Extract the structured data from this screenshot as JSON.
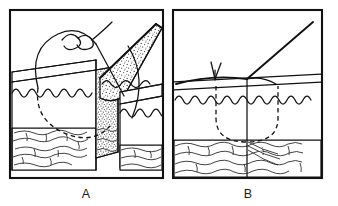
{
  "figure": {
    "background_color": "#ffffff",
    "ink_color": "#111111",
    "width": 338,
    "height": 206,
    "panels": [
      {
        "id": "A",
        "label": "A",
        "caption_position": "below",
        "view": "three-quarter block diagram",
        "description": "Skin block with elevated dermal flap, stippled cut dermis surface, wavy epidermal surface line, lobular subcutaneous fat, and a suture loop with knot above the surface",
        "frame": {
          "x": 10,
          "y": 10,
          "width": 153,
          "height": 168
        },
        "features": [
          {
            "name": "epidermis-wavy-line",
            "label": "epidermis"
          },
          {
            "name": "dermis-stipple-surface",
            "label": "cut dermis (stippled)"
          },
          {
            "name": "subcutaneous-fat-lobules",
            "label": "subcutaneous fat"
          },
          {
            "name": "elevated-flap-wedge",
            "label": "undermined flap"
          },
          {
            "name": "suture-knot-loop",
            "label": "suture knot"
          },
          {
            "name": "buried-suture-dashed-path",
            "label": "buried suture (hidden)"
          }
        ]
      },
      {
        "id": "B",
        "label": "B",
        "caption_position": "below",
        "view": "cross-sectional diagram",
        "description": "Cross-section of approximated skin edges with a dashed buried suture loop passing through the dermis, suture strand exiting upward with a cut-tail arrow",
        "frame": {
          "x": 173,
          "y": 10,
          "width": 149,
          "height": 168
        },
        "features": [
          {
            "name": "epidermis-wavy-line",
            "label": "epidermis"
          },
          {
            "name": "dermis-band",
            "label": "dermis"
          },
          {
            "name": "subcutaneous-fat-lobules",
            "label": "subcutaneous fat"
          },
          {
            "name": "buried-suture-dashed-loop",
            "label": "buried suture loop"
          },
          {
            "name": "suture-strand",
            "label": "suture strand"
          },
          {
            "name": "suture-cut-tail",
            "label": "cut tail"
          },
          {
            "name": "wound-midline",
            "label": "wound midline"
          }
        ]
      }
    ]
  }
}
